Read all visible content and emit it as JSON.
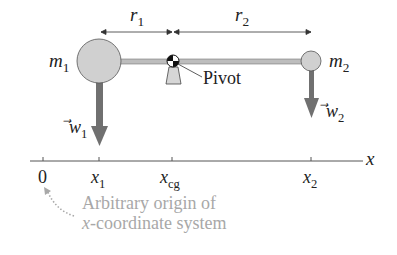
{
  "diagram": {
    "labels": {
      "r1": "r",
      "r1_sub": "1",
      "r2": "r",
      "r2_sub": "2",
      "m1": "m",
      "m1_sub": "1",
      "m2": "m",
      "m2_sub": "2",
      "pivot": "Pivot",
      "w1": "w",
      "w1_sub": "1",
      "w2": "w",
      "w2_sub": "2",
      "axis": "x",
      "origin": "0",
      "x1": "x",
      "x1_sub": "1",
      "xcg": "x",
      "xcg_sub": "cg",
      "x2": "x",
      "x2_sub": "2",
      "note_line1": "Arbitrary origin of",
      "note_line2_italic": "x",
      "note_line2_rest": "-coordinate system"
    },
    "colors": {
      "mass_fill": "#cfcfcf",
      "rod": "#9a9a9a",
      "weight_arrow": "#6e6e6e",
      "note_text": "#a8a8a8",
      "axis": "#555555"
    }
  }
}
